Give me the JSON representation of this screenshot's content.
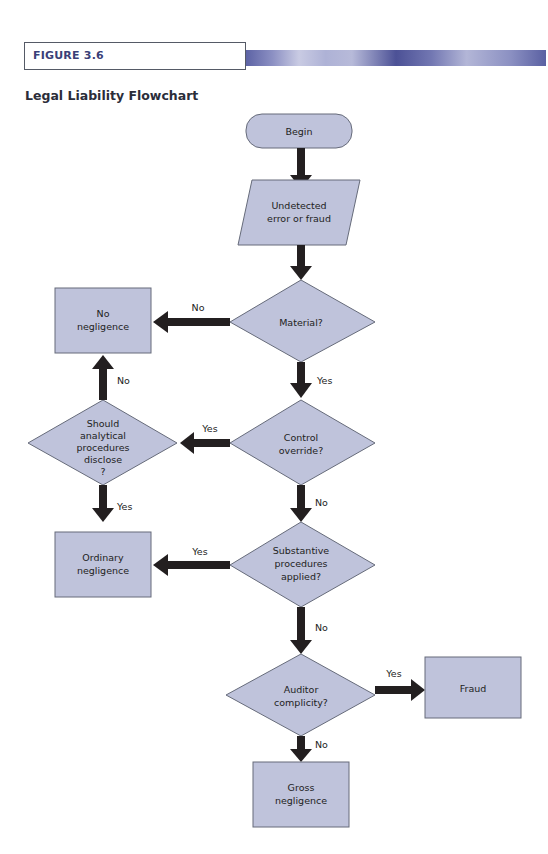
{
  "figure": {
    "label": "FIGURE 3.6",
    "title": "Legal Liability Flowchart",
    "accent_color": "#3a3f78"
  },
  "nodes": {
    "begin": {
      "type": "terminator",
      "lines": [
        "Begin"
      ]
    },
    "undetected": {
      "type": "input",
      "lines": [
        "Undetected",
        "error or fraud"
      ]
    },
    "material": {
      "type": "decision",
      "lines": [
        "Material?"
      ]
    },
    "no_negligence": {
      "type": "process",
      "lines": [
        "No",
        "negligence"
      ]
    },
    "control_override": {
      "type": "decision",
      "lines": [
        "Control",
        "override?"
      ]
    },
    "should_analytical": {
      "type": "decision",
      "lines": [
        "Should",
        "analytical",
        "procedures",
        "disclose",
        "?"
      ]
    },
    "ordinary_negligence": {
      "type": "process",
      "lines": [
        "Ordinary",
        "negligence"
      ]
    },
    "substantive": {
      "type": "decision",
      "lines": [
        "Substantive",
        "procedures",
        "applied?"
      ]
    },
    "auditor_complicity": {
      "type": "decision",
      "lines": [
        "Auditor",
        "complicity?"
      ]
    },
    "fraud": {
      "type": "process",
      "lines": [
        "Fraud"
      ]
    },
    "gross_negligence": {
      "type": "process",
      "lines": [
        "Gross",
        "negligence"
      ]
    }
  },
  "edges": [
    {
      "from": "begin",
      "to": "undetected",
      "label": ""
    },
    {
      "from": "undetected",
      "to": "material",
      "label": ""
    },
    {
      "from": "material",
      "to": "no_negligence",
      "label": "No"
    },
    {
      "from": "material",
      "to": "control_override",
      "label": "Yes"
    },
    {
      "from": "control_override",
      "to": "should_analytical",
      "label": "Yes"
    },
    {
      "from": "should_analytical",
      "to": "no_negligence",
      "label": "No"
    },
    {
      "from": "should_analytical",
      "to": "ordinary_negligence",
      "label": "Yes"
    },
    {
      "from": "control_override",
      "to": "substantive",
      "label": "No"
    },
    {
      "from": "substantive",
      "to": "ordinary_negligence",
      "label": "Yes"
    },
    {
      "from": "substantive",
      "to": "auditor_complicity",
      "label": "No"
    },
    {
      "from": "auditor_complicity",
      "to": "fraud",
      "label": "Yes"
    },
    {
      "from": "auditor_complicity",
      "to": "gross_negligence",
      "label": "No"
    }
  ],
  "labels": {
    "material_no": "No",
    "material_yes": "Yes",
    "control_yes": "Yes",
    "control_no": "No",
    "analytical_no": "No",
    "analytical_yes": "Yes",
    "substantive_yes": "Yes",
    "substantive_no": "No",
    "complicity_yes": "Yes",
    "complicity_no": "No"
  }
}
